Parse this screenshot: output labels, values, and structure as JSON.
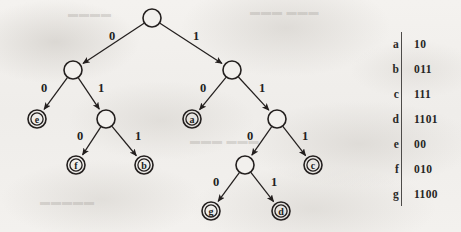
{
  "figure": {
    "type": "binary-prefix-code-tree",
    "title": "",
    "background_color": "#f1efec",
    "ink_color": "#231f1e"
  },
  "tree": {
    "root_id": "root",
    "nodes": [
      {
        "id": "root",
        "kind": "internal",
        "label": "",
        "x": 152,
        "y": 18,
        "r": 9
      },
      {
        "id": "n0",
        "kind": "internal",
        "label": "",
        "x": 73,
        "y": 70,
        "r": 9
      },
      {
        "id": "n1",
        "kind": "internal",
        "label": "",
        "x": 232,
        "y": 70,
        "r": 9
      },
      {
        "id": "e",
        "kind": "leaf",
        "label": "e",
        "x": 37,
        "y": 119,
        "r": 9
      },
      {
        "id": "n01",
        "kind": "internal",
        "label": "",
        "x": 106,
        "y": 119,
        "r": 9
      },
      {
        "id": "a",
        "kind": "leaf",
        "label": "a",
        "x": 192,
        "y": 119,
        "r": 9
      },
      {
        "id": "n11",
        "kind": "internal",
        "label": "",
        "x": 277,
        "y": 119,
        "r": 9
      },
      {
        "id": "f",
        "kind": "leaf",
        "label": "f",
        "x": 76,
        "y": 165,
        "r": 9
      },
      {
        "id": "b",
        "kind": "leaf",
        "label": "b",
        "x": 144,
        "y": 165,
        "r": 9
      },
      {
        "id": "n110",
        "kind": "internal",
        "label": "",
        "x": 245,
        "y": 165,
        "r": 9
      },
      {
        "id": "c",
        "kind": "leaf",
        "label": "c",
        "x": 313,
        "y": 165,
        "r": 9
      },
      {
        "id": "g",
        "kind": "leaf",
        "label": "g",
        "x": 211,
        "y": 211,
        "r": 9
      },
      {
        "id": "d",
        "kind": "leaf",
        "label": "d",
        "x": 281,
        "y": 211,
        "r": 9
      }
    ],
    "edges": [
      {
        "from": "root",
        "to": "n0",
        "label": "0",
        "label_x": 112,
        "label_y": 40
      },
      {
        "from": "root",
        "to": "n1",
        "label": "1",
        "label_x": 196,
        "label_y": 40
      },
      {
        "from": "n0",
        "to": "e",
        "label": "0",
        "label_x": 44,
        "label_y": 92
      },
      {
        "from": "n0",
        "to": "n01",
        "label": "1",
        "label_x": 101,
        "label_y": 92
      },
      {
        "from": "n1",
        "to": "a",
        "label": "0",
        "label_x": 203,
        "label_y": 92
      },
      {
        "from": "n1",
        "to": "n11",
        "label": "1",
        "label_x": 262,
        "label_y": 92
      },
      {
        "from": "n01",
        "to": "f",
        "label": "0",
        "label_x": 80,
        "label_y": 140
      },
      {
        "from": "n01",
        "to": "b",
        "label": "1",
        "label_x": 138,
        "label_y": 140
      },
      {
        "from": "n11",
        "to": "n110",
        "label": "0",
        "label_x": 250,
        "label_y": 140
      },
      {
        "from": "n11",
        "to": "c",
        "label": "1",
        "label_x": 305,
        "label_y": 140
      },
      {
        "from": "n110",
        "to": "g",
        "label": "0",
        "label_x": 216,
        "label_y": 186
      },
      {
        "from": "n110",
        "to": "d",
        "label": "1",
        "label_x": 274,
        "label_y": 186
      }
    ]
  },
  "code_table": {
    "rows": [
      {
        "symbol": "a",
        "code": "10"
      },
      {
        "symbol": "b",
        "code": "011"
      },
      {
        "symbol": "c",
        "code": "111"
      },
      {
        "symbol": "d",
        "code": "1101"
      },
      {
        "symbol": "e",
        "code": "00"
      },
      {
        "symbol": "f",
        "code": "010"
      },
      {
        "symbol": "g",
        "code": "1100"
      }
    ]
  }
}
